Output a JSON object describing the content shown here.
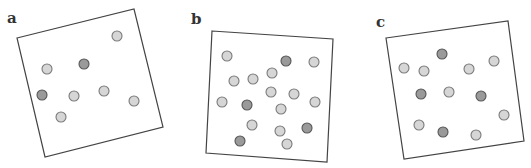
{
  "figure": {
    "colors": {
      "light_dot_fill": "#d6d6d6",
      "light_dot_stroke": "#7a7a7a",
      "dark_dot_fill": "#9a9a9a",
      "dark_dot_stroke": "#555555",
      "frame_stroke": "#444444"
    },
    "panels": [
      {
        "id": "a",
        "label": "a",
        "light_count": 6,
        "dark_count": 2
      },
      {
        "id": "b",
        "label": "b",
        "light_count": 13,
        "dark_count": 4
      },
      {
        "id": "c",
        "label": "c",
        "light_count": 8,
        "dark_count": 4
      }
    ]
  }
}
